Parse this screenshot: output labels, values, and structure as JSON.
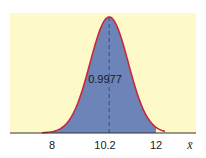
{
  "chart_data": {
    "type": "area",
    "title": "",
    "subtitle": "",
    "xlabel": "x̄",
    "ylabel": "",
    "distribution": {
      "mean": 10.2,
      "sd": 0.733
    },
    "shaded_interval": [
      8,
      12
    ],
    "shaded_area_label": "0.9977",
    "x_ticks": [
      {
        "value": 8,
        "label": "8"
      },
      {
        "value": 10.2,
        "label": "10.2"
      },
      {
        "value": 12,
        "label": "12"
      }
    ],
    "mean_line": {
      "value": 10.2,
      "style": "dashed"
    },
    "xlim": [
      6.5,
      13.8
    ],
    "grid": false,
    "legend": "none",
    "colors": {
      "background_panel": "#fdf9c8",
      "shaded_fill": "#6d84b8",
      "curve_stroke": "#c8283c",
      "axis": "#333333",
      "mean_line": "#3a4a78"
    }
  },
  "labels": {
    "area_value": "0.9977",
    "tick_8": "8",
    "tick_mean": "10.2",
    "tick_12": "12",
    "axis_variable": "x̄"
  }
}
